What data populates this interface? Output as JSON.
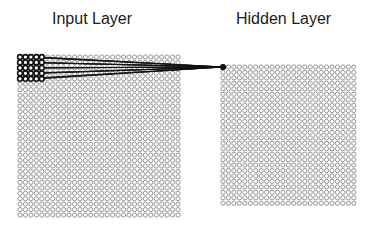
{
  "labels": {
    "input_layer": "Input Layer",
    "hidden_layer": "Hidden Layer"
  },
  "layers": {
    "input": {
      "rows": 30,
      "cols": 30,
      "receptive_field": {
        "rows": 5,
        "cols": 5
      }
    },
    "hidden": {
      "rows": 26,
      "cols": 25,
      "highlighted_node": {
        "row": 0,
        "col": 0
      }
    }
  },
  "colors": {
    "node_stroke": "#8a8a8a",
    "active_node": "#111111",
    "connection": "#111111",
    "text": "#1a1a1a"
  }
}
